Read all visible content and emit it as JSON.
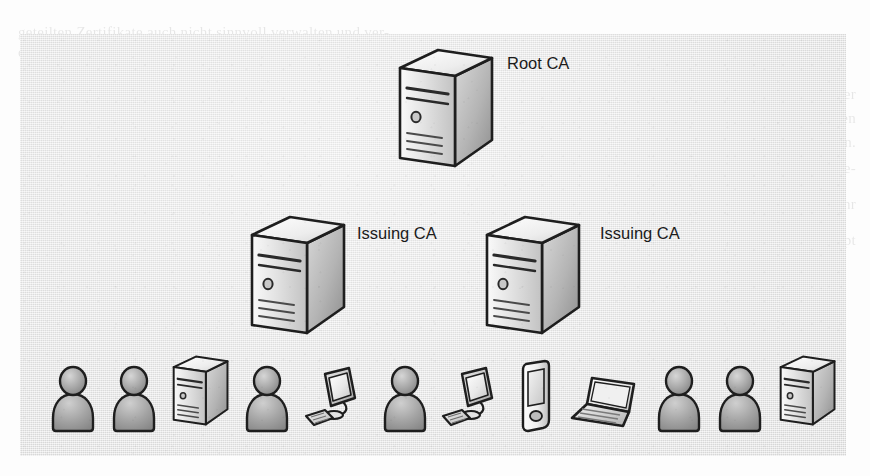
{
  "page": {
    "ghost_text": {
      "top_line_1": "geteilten Zertifikate auch nicht sinnvoll verwalten und ver-",
      "top_line_2": "den.",
      "right_line_1": "kann die vom Aufgaben von jedem Einsatz nicht jeder fest, der",
      "right_line_2": "Zertifikatsnehmer ja garantiert werden muss. Also muss jedes den",
      "right_line_3": "werden.",
      "right_line_4": "zung. Nach einer Zertifizierungsstelle im Unternehmen selbst be-",
      "right_line_5": "treiben. Die Entscheidung darüber, ob was in der Rolle von einer sehr",
      "right_line_6": "aktiv, überhaupt",
      "right_line_7": "",
      "bottom_line_1": ""
    }
  },
  "diagram": {
    "type": "pki-hierarchy",
    "title_visible": false,
    "background_color": "#e8e8e8",
    "tiers": [
      {
        "level": 1,
        "nodes": [
          {
            "id": "root-ca",
            "label": "Root CA",
            "icon": "server-icon"
          }
        ]
      },
      {
        "level": 2,
        "nodes": [
          {
            "id": "issuing-ca-1",
            "label": "Issuing CA",
            "icon": "server-icon"
          },
          {
            "id": "issuing-ca-2",
            "label": "Issuing CA",
            "icon": "server-icon"
          }
        ]
      },
      {
        "level": 3,
        "label": "",
        "nodes": [
          {
            "id": "client-1",
            "label": "",
            "icon": "user-icon"
          },
          {
            "id": "client-2",
            "label": "",
            "icon": "user-icon"
          },
          {
            "id": "client-3",
            "label": "",
            "icon": "server-icon"
          },
          {
            "id": "client-4",
            "label": "",
            "icon": "user-icon"
          },
          {
            "id": "client-5",
            "label": "",
            "icon": "desktop-computer-icon"
          },
          {
            "id": "client-6",
            "label": "",
            "icon": "user-icon"
          },
          {
            "id": "client-7",
            "label": "",
            "icon": "desktop-computer-icon"
          },
          {
            "id": "client-8",
            "label": "",
            "icon": "mobile-phone-icon"
          },
          {
            "id": "client-9",
            "label": "",
            "icon": "laptop-icon"
          },
          {
            "id": "client-10",
            "label": "",
            "icon": "user-icon"
          },
          {
            "id": "client-11",
            "label": "",
            "icon": "user-icon"
          },
          {
            "id": "client-12",
            "label": "",
            "icon": "server-icon"
          }
        ]
      }
    ],
    "labels": {
      "root_ca": "Root CA",
      "issuing_ca_left": "Issuing CA",
      "issuing_ca_right": "Issuing CA"
    },
    "colors": {
      "panel": "#e8e8e8",
      "icon_outline": "#222222",
      "icon_light": "#f2f2f2",
      "icon_mid": "#cfcfcf",
      "icon_dark": "#9a9a9a",
      "label_text": "#1b1b1b"
    }
  }
}
